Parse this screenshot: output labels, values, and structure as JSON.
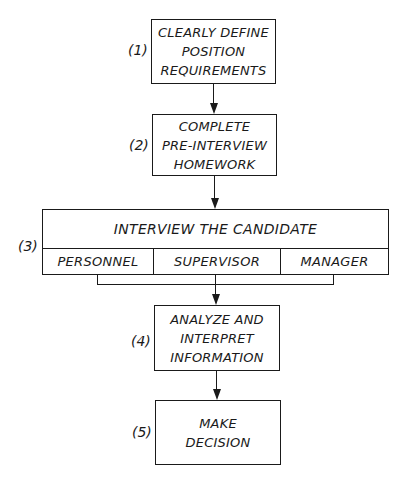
{
  "steps": [
    {
      "number": "(1)",
      "lines": [
        "CLEARLY DEFINE",
        "POSITION",
        "REQUIREMENTS"
      ]
    },
    {
      "number": "(2)",
      "lines": [
        "COMPLETE",
        "PRE-INTERVIEW",
        "HOMEWORK"
      ]
    },
    {
      "number": "(3)",
      "title": "INTERVIEW THE CANDIDATE",
      "parts": [
        "PERSONNEL",
        "SUPERVISOR",
        "MANAGER"
      ]
    },
    {
      "number": "(4)",
      "lines": [
        "ANALYZE AND",
        "INTERPRET",
        "INFORMATION"
      ]
    },
    {
      "number": "(5)",
      "lines": [
        "MAKE",
        "DECISION"
      ]
    }
  ]
}
